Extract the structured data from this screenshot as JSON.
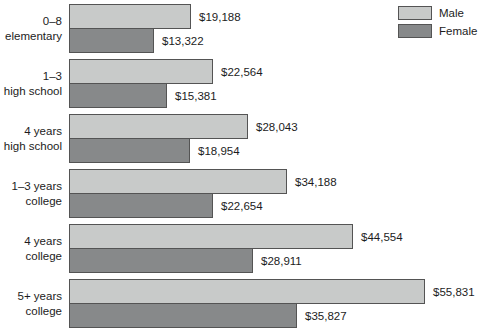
{
  "chart_data": {
    "type": "bar",
    "orientation": "horizontal",
    "title": "",
    "xlabel": "",
    "ylabel": "",
    "grid": false,
    "legend_position": "top-right",
    "value_axis_max": 55831,
    "categories": [
      [
        "0–8",
        "elementary"
      ],
      [
        "1–3",
        "high school"
      ],
      [
        "4 years",
        "high school"
      ],
      [
        "1–3 years",
        "college"
      ],
      [
        "4 years",
        "college"
      ],
      [
        "5+ years",
        "college"
      ]
    ],
    "series": [
      {
        "name": "Male",
        "color": "#c8cac9",
        "values": [
          19188,
          22564,
          28043,
          34188,
          44554,
          55831
        ],
        "labels": [
          "$19,188",
          "$22,564",
          "$28,043",
          "$34,188",
          "$44,554",
          "$55,831"
        ]
      },
      {
        "name": "Female",
        "color": "#87898a",
        "values": [
          13322,
          15381,
          18954,
          22654,
          28911,
          35827
        ],
        "labels": [
          "$13,322",
          "$15,381",
          "$18,954",
          "$22,654",
          "$28,911",
          "$35,827"
        ]
      }
    ],
    "colors": {
      "bar_border": "#545454",
      "background": "#ffffff",
      "text": "#1c1c1c"
    }
  }
}
